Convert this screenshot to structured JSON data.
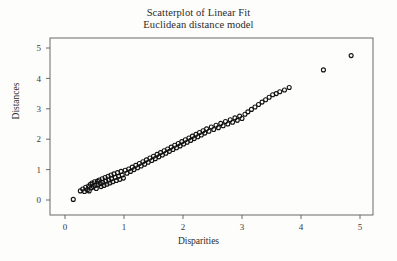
{
  "chart_data": {
    "type": "scatter",
    "title": "Scatterplot of Linear Fit",
    "subtitle": "Euclidean distance model",
    "xlabel": "Disparities",
    "ylabel": "Distances",
    "xlim": [
      -0.18,
      5.35
    ],
    "ylim": [
      -0.28,
      5.45
    ],
    "xticks": [
      0,
      1,
      2,
      3,
      4,
      5
    ],
    "yticks": [
      0,
      1,
      2,
      3,
      4,
      5
    ],
    "xticklabels": [
      "0",
      "1",
      "2",
      "3",
      "4",
      "5"
    ],
    "yticklabels": [
      "0",
      "1",
      "2",
      "3",
      "4",
      "5"
    ],
    "grid": false,
    "legend": false,
    "marker": "open-circle",
    "marker_color": "#111111",
    "marker_size": 4,
    "frame": true,
    "series": [
      {
        "name": "Euclidean distance fit",
        "points": [
          [
            0.14,
            0.02
          ],
          [
            0.26,
            0.3
          ],
          [
            0.3,
            0.36
          ],
          [
            0.33,
            0.28
          ],
          [
            0.35,
            0.42
          ],
          [
            0.38,
            0.34
          ],
          [
            0.4,
            0.46
          ],
          [
            0.41,
            0.3
          ],
          [
            0.43,
            0.52
          ],
          [
            0.45,
            0.4
          ],
          [
            0.46,
            0.56
          ],
          [
            0.48,
            0.44
          ],
          [
            0.5,
            0.6
          ],
          [
            0.51,
            0.48
          ],
          [
            0.53,
            0.38
          ],
          [
            0.55,
            0.62
          ],
          [
            0.56,
            0.5
          ],
          [
            0.58,
            0.66
          ],
          [
            0.6,
            0.54
          ],
          [
            0.61,
            0.44
          ],
          [
            0.63,
            0.7
          ],
          [
            0.64,
            0.58
          ],
          [
            0.66,
            0.48
          ],
          [
            0.68,
            0.74
          ],
          [
            0.69,
            0.62
          ],
          [
            0.71,
            0.52
          ],
          [
            0.73,
            0.78
          ],
          [
            0.74,
            0.66
          ],
          [
            0.76,
            0.56
          ],
          [
            0.78,
            0.82
          ],
          [
            0.79,
            0.7
          ],
          [
            0.81,
            0.6
          ],
          [
            0.83,
            0.86
          ],
          [
            0.85,
            0.74
          ],
          [
            0.87,
            0.64
          ],
          [
            0.89,
            0.9
          ],
          [
            0.91,
            0.78
          ],
          [
            0.93,
            0.68
          ],
          [
            0.95,
            0.94
          ],
          [
            0.97,
            0.82
          ],
          [
            0.99,
            0.72
          ],
          [
            1.02,
            0.98
          ],
          [
            1.05,
            0.88
          ],
          [
            1.08,
            1.02
          ],
          [
            1.11,
            0.94
          ],
          [
            1.14,
            1.08
          ],
          [
            1.17,
            1.0
          ],
          [
            1.2,
            1.14
          ],
          [
            1.23,
            1.06
          ],
          [
            1.26,
            1.2
          ],
          [
            1.29,
            1.12
          ],
          [
            1.32,
            1.26
          ],
          [
            1.35,
            1.18
          ],
          [
            1.38,
            1.32
          ],
          [
            1.41,
            1.24
          ],
          [
            1.44,
            1.38
          ],
          [
            1.47,
            1.3
          ],
          [
            1.5,
            1.44
          ],
          [
            1.53,
            1.36
          ],
          [
            1.56,
            1.5
          ],
          [
            1.59,
            1.42
          ],
          [
            1.62,
            1.56
          ],
          [
            1.65,
            1.48
          ],
          [
            1.68,
            1.62
          ],
          [
            1.71,
            1.54
          ],
          [
            1.74,
            1.68
          ],
          [
            1.77,
            1.6
          ],
          [
            1.8,
            1.74
          ],
          [
            1.83,
            1.66
          ],
          [
            1.86,
            1.8
          ],
          [
            1.89,
            1.72
          ],
          [
            1.92,
            1.86
          ],
          [
            1.95,
            1.78
          ],
          [
            1.98,
            1.92
          ],
          [
            2.01,
            1.84
          ],
          [
            2.04,
            1.98
          ],
          [
            2.07,
            1.9
          ],
          [
            2.1,
            2.04
          ],
          [
            2.13,
            1.96
          ],
          [
            2.16,
            2.1
          ],
          [
            2.19,
            2.02
          ],
          [
            2.22,
            2.16
          ],
          [
            2.25,
            2.08
          ],
          [
            2.28,
            2.22
          ],
          [
            2.31,
            2.14
          ],
          [
            2.34,
            2.28
          ],
          [
            2.37,
            2.2
          ],
          [
            2.4,
            2.34
          ],
          [
            2.44,
            2.26
          ],
          [
            2.48,
            2.4
          ],
          [
            2.52,
            2.32
          ],
          [
            2.56,
            2.46
          ],
          [
            2.6,
            2.38
          ],
          [
            2.64,
            2.52
          ],
          [
            2.68,
            2.44
          ],
          [
            2.72,
            2.58
          ],
          [
            2.76,
            2.5
          ],
          [
            2.8,
            2.64
          ],
          [
            2.84,
            2.56
          ],
          [
            2.88,
            2.7
          ],
          [
            2.92,
            2.62
          ],
          [
            2.96,
            2.76
          ],
          [
            3.0,
            2.68
          ],
          [
            3.05,
            2.82
          ],
          [
            3.1,
            2.9
          ],
          [
            3.16,
            2.98
          ],
          [
            3.22,
            3.06
          ],
          [
            3.28,
            3.14
          ],
          [
            3.34,
            3.22
          ],
          [
            3.4,
            3.3
          ],
          [
            3.46,
            3.38
          ],
          [
            3.52,
            3.46
          ],
          [
            3.58,
            3.5
          ],
          [
            3.64,
            3.56
          ],
          [
            3.72,
            3.62
          ],
          [
            3.8,
            3.7
          ],
          [
            4.38,
            4.28
          ],
          [
            4.85,
            4.75
          ]
        ]
      }
    ]
  }
}
